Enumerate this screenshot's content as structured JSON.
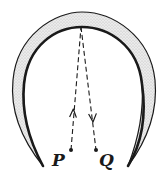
{
  "diagram": {
    "type": "ray-reflection-curved-mirror",
    "colors": {
      "ink": "#1a1a1a",
      "mirror_fill": "#d9d9d9",
      "background": "#ffffff"
    },
    "points": [
      {
        "label": "P",
        "x": 71,
        "y": 150
      },
      {
        "label": "Q",
        "x": 96,
        "y": 150
      }
    ],
    "reflection_point": {
      "x": 81,
      "y": 27
    },
    "rays": [
      {
        "from": "P",
        "to": "reflection_point",
        "direction": "up",
        "style": "dashed"
      },
      {
        "from": "reflection_point",
        "to": "Q",
        "direction": "down",
        "style": "dashed"
      }
    ]
  }
}
